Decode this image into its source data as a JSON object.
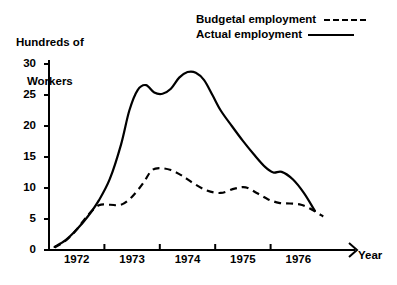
{
  "chart_data": {
    "type": "line",
    "title": "",
    "ylabel": "Hundreds of\nWorkers",
    "ylabel_line1": "Hundreds of",
    "ylabel_line2": "Workers",
    "xlabel": "Year",
    "ylim": [
      0,
      30
    ],
    "xlim": [
      1971.5,
      1976.5
    ],
    "grid": false,
    "legend_position": "top-right",
    "yticks": [
      0,
      5,
      10,
      15,
      20,
      25,
      30
    ],
    "ytick_labels": [
      "0",
      "5",
      "10",
      "15",
      "20",
      "25",
      "30"
    ],
    "xtick_labels": [
      "1972",
      "1973",
      "1974",
      "1975",
      "1976"
    ],
    "xtick_values": [
      1972,
      1973,
      1974,
      1975,
      1976
    ],
    "series": [
      {
        "name": "Actual employment",
        "style": "solid",
        "legend_sample": "solid-line",
        "x": [
          1971.6,
          1971.8,
          1972.0,
          1972.2,
          1972.4,
          1972.6,
          1972.8,
          1972.95,
          1973.1,
          1973.25,
          1973.4,
          1973.55,
          1973.7,
          1973.85,
          1974.0,
          1974.15,
          1974.3,
          1974.45,
          1974.6,
          1974.8,
          1975.0,
          1975.2,
          1975.4,
          1975.55,
          1975.7,
          1975.9,
          1976.1,
          1976.3
        ],
        "values": [
          0.5,
          1.6,
          3.3,
          5.4,
          8.0,
          11.5,
          17.0,
          22.5,
          25.8,
          26.6,
          25.4,
          25.2,
          26.0,
          27.8,
          28.7,
          28.6,
          27.4,
          25.0,
          22.5,
          20.0,
          17.6,
          15.4,
          13.4,
          12.5,
          12.6,
          11.4,
          9.2,
          6.3
        ]
      },
      {
        "name": "Budgetal employment",
        "style": "dashed",
        "legend_sample": "dashed-line",
        "x": [
          1971.6,
          1971.8,
          1972.0,
          1972.2,
          1972.4,
          1972.6,
          1972.8,
          1973.0,
          1973.2,
          1973.35,
          1973.5,
          1973.7,
          1973.9,
          1974.1,
          1974.35,
          1974.6,
          1974.85,
          1975.05,
          1975.25,
          1975.45,
          1975.65,
          1975.85,
          1976.05,
          1976.25,
          1976.45
        ],
        "values": [
          0.4,
          1.5,
          3.3,
          5.6,
          7.2,
          7.3,
          7.3,
          8.6,
          10.8,
          12.8,
          13.2,
          12.9,
          12.0,
          10.8,
          9.6,
          9.2,
          9.9,
          10.1,
          9.2,
          8.2,
          7.6,
          7.5,
          7.3,
          6.5,
          5.4
        ]
      }
    ]
  },
  "legend": {
    "entries": [
      {
        "label": "Budgetal employment",
        "sample": "dashed"
      },
      {
        "label": "Actual employment",
        "sample": "solid"
      }
    ]
  }
}
